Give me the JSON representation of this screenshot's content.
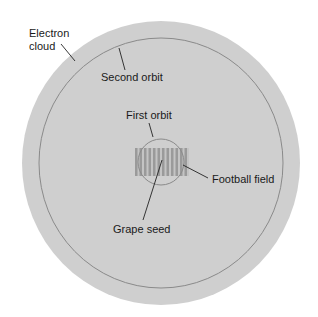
{
  "diagram": {
    "labels": {
      "electron_cloud_line1": "Electron",
      "electron_cloud_line2": "cloud",
      "second_orbit": "Second orbit",
      "first_orbit": "First orbit",
      "football_field": "Football field",
      "grape_seed": "Grape seed"
    },
    "colors": {
      "cloud_fill": "#cfcfcf",
      "orbit_stroke": "#8a8a8a",
      "field_stripe_dark": "#9a9a9a",
      "field_stripe_light": "#c4c4c4",
      "leader_line": "#222222",
      "text": "#1a1a1a"
    }
  }
}
